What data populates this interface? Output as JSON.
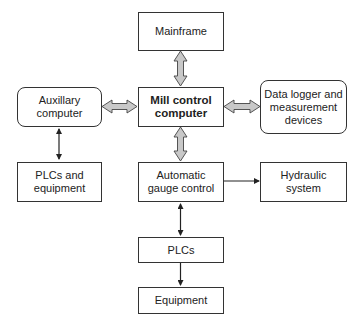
{
  "diagram": {
    "nodes": {
      "mainframe": "Mainframe",
      "mill_control": "Mill control\ncomputer",
      "auxillary": "Auxillary\ncomputer",
      "data_logger": "Data logger and\nmeasurement\ndevices",
      "plcs_equipment": "PLCs and\nequipment",
      "agc": "Automatic\ngauge control",
      "hydraulic": "Hydraulic\nsystem",
      "plcs": "PLCs",
      "equipment": "Equipment"
    },
    "edges": [
      {
        "from": "mainframe",
        "to": "mill_control",
        "type": "bidirectional-block"
      },
      {
        "from": "auxillary",
        "to": "mill_control",
        "type": "bidirectional-block"
      },
      {
        "from": "mill_control",
        "to": "data_logger",
        "type": "bidirectional-block"
      },
      {
        "from": "mill_control",
        "to": "agc",
        "type": "bidirectional-block"
      },
      {
        "from": "auxillary",
        "to": "plcs_equipment",
        "type": "bidirectional-line"
      },
      {
        "from": "agc",
        "to": "hydraulic",
        "type": "directed-line"
      },
      {
        "from": "agc",
        "to": "plcs",
        "type": "bidirectional-line"
      },
      {
        "from": "plcs",
        "to": "equipment",
        "type": "directed-line"
      }
    ]
  }
}
